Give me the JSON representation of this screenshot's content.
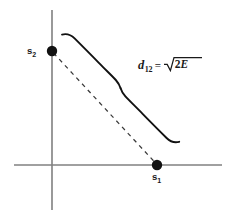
{
  "figure": {
    "type": "geometric-diagram",
    "background_color": "#ffffff",
    "axis_color": "#808080",
    "ink_color": "#1a1a1a",
    "axes": {
      "x_axis": {
        "name": "horizontal-axis",
        "x1": 14,
        "y1": 165,
        "x2": 222,
        "y2": 165
      },
      "y_axis": {
        "name": "vertical-axis",
        "x1": 52,
        "y1": 10,
        "x2": 52,
        "y2": 210
      }
    },
    "points": [
      {
        "id": "s2",
        "label": "s",
        "subscript": "2",
        "cx": 52,
        "cy": 51,
        "r": 5.2,
        "label_position": "left"
      },
      {
        "id": "s1",
        "label": "s",
        "subscript": "1",
        "cx": 157,
        "cy": 165,
        "r": 5.2,
        "label_position": "below"
      }
    ],
    "segment": {
      "name": "distance-segment",
      "style": "dashed",
      "from": "s2",
      "to": "s1",
      "dash_pattern": "4,4"
    },
    "brace": {
      "name": "measurement-brace",
      "orientation": "diagonal",
      "cusp_x": 120,
      "cusp_y": 88
    },
    "annotation": {
      "name": "distance-formula",
      "variable": "d",
      "subscript": "12",
      "equals": "=",
      "radical_sign": "√",
      "radicand_number": "2",
      "radicand_variable": "E",
      "full_text": "d12 = √(2E)"
    }
  }
}
